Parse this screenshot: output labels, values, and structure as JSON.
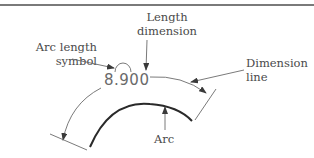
{
  "diagram": {
    "dimension_value": "8.900",
    "labels": {
      "length_dimension": [
        "Length",
        "dimension"
      ],
      "arc_length_symbol": [
        "Arc length",
        "symbol"
      ],
      "dimension_line": [
        "Dimension",
        "line"
      ],
      "arc": "Arc"
    },
    "colors": {
      "line": "#6b6b6b",
      "arc": "#2a2a2a",
      "text": "#4a4a4a",
      "rule": "#7a7a7a"
    }
  }
}
